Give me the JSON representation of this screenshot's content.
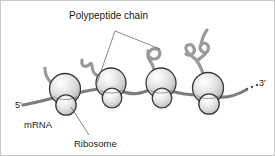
{
  "figure": {
    "background_color": "#ffffff",
    "border_color": "#c9c9c9"
  },
  "labels": {
    "polypeptide_chain": "Polypeptide chain",
    "mrna": "mRNA",
    "ribosome": "Ribosome",
    "five_prime": "5'",
    "three_prime": "3'",
    "three_prime_ellipsis": "..."
  },
  "colors": {
    "strand": "#7d7d7d",
    "chain": "#9a9a9a",
    "ribosome_outline": "#3a3a3a",
    "ribosome_light": "#fdfdfd",
    "ribosome_mid": "#d8d8d8",
    "ribosome_dark": "#a8a8a8",
    "leader_line": "#4a5a6a",
    "text": "#1a1a1a"
  },
  "ribosomes": [
    {
      "id": "ribosome-1",
      "x": 64,
      "y": 94,
      "large_r": 15.5,
      "small_r": 10.0
    },
    {
      "id": "ribosome-2",
      "x": 110,
      "y": 88,
      "large_r": 15.0,
      "small_r": 9.5
    },
    {
      "id": "ribosome-3",
      "x": 160,
      "y": 88,
      "large_r": 15.0,
      "small_r": 9.5
    },
    {
      "id": "ribosome-4",
      "x": 207,
      "y": 93,
      "large_r": 15.5,
      "small_r": 10.0
    }
  ],
  "polypeptide_chains": [
    {
      "id": "chain-1",
      "attached_to": "ribosome-1",
      "length": "short",
      "description": "short simple curve"
    },
    {
      "id": "chain-2",
      "attached_to": "ribosome-2",
      "length": "medium",
      "description": "zigzag kink"
    },
    {
      "id": "chain-3",
      "attached_to": "ribosome-3",
      "length": "long",
      "description": "single loop curl"
    },
    {
      "id": "chain-4",
      "attached_to": "ribosome-4",
      "length": "longest",
      "description": "multiple loops and curls"
    }
  ],
  "leader_lines": [
    {
      "id": "leader-to-chain-2",
      "from": "polypeptide-chain-label",
      "to": "chain-2"
    },
    {
      "id": "leader-to-chain-3",
      "from": "polypeptide-chain-label",
      "to": "chain-3"
    },
    {
      "id": "leader-to-ribosome-1",
      "from": "ribosome-label",
      "to": "ribosome-1"
    }
  ]
}
